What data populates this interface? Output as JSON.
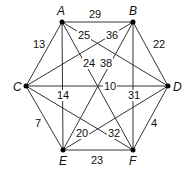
{
  "graph": {
    "nodes": [
      {
        "id": "A",
        "label": "A",
        "x": 62,
        "y": 22
      },
      {
        "id": "B",
        "label": "B",
        "x": 133,
        "y": 22
      },
      {
        "id": "C",
        "label": "C",
        "x": 26,
        "y": 86
      },
      {
        "id": "D",
        "label": "D",
        "x": 168,
        "y": 86
      },
      {
        "id": "E",
        "label": "E",
        "x": 63,
        "y": 150
      },
      {
        "id": "F",
        "label": "F",
        "x": 133,
        "y": 150
      }
    ],
    "edges": [
      {
        "from": "A",
        "to": "B",
        "weight": "29"
      },
      {
        "from": "A",
        "to": "C",
        "weight": "13"
      },
      {
        "from": "A",
        "to": "D",
        "weight": "25"
      },
      {
        "from": "A",
        "to": "E",
        "weight": "14"
      },
      {
        "from": "A",
        "to": "F",
        "weight": "24"
      },
      {
        "from": "B",
        "to": "C",
        "weight": "36"
      },
      {
        "from": "B",
        "to": "D",
        "weight": "22"
      },
      {
        "from": "B",
        "to": "E",
        "weight": "38"
      },
      {
        "from": "B",
        "to": "F",
        "weight": "31"
      },
      {
        "from": "C",
        "to": "D",
        "weight": "10"
      },
      {
        "from": "C",
        "to": "E",
        "weight": "7"
      },
      {
        "from": "C",
        "to": "F",
        "weight": "32"
      },
      {
        "from": "D",
        "to": "E",
        "weight": "20"
      },
      {
        "from": "D",
        "to": "F",
        "weight": "4"
      },
      {
        "from": "E",
        "to": "F",
        "weight": "23"
      }
    ]
  },
  "labels": {
    "A": "A",
    "B": "B",
    "C": "C",
    "D": "D",
    "E": "E",
    "F": "F",
    "w_AB": "29",
    "w_AC": "13",
    "w_AD": "25",
    "w_AE": "14",
    "w_AF": "24",
    "w_BC": "36",
    "w_BD": "22",
    "w_BE": "38",
    "w_BF": "31",
    "w_CD": "10",
    "w_CE": "7",
    "w_CF": "32",
    "w_DE": "20",
    "w_DF": "4",
    "w_EF": "23"
  }
}
